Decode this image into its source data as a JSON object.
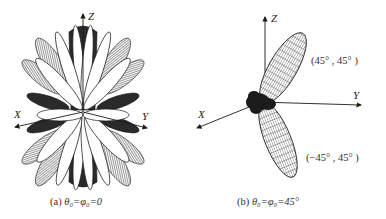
{
  "figures": [
    {
      "id": "a",
      "caption": "(a) θ₀=φ₀=0",
      "caption_prefix": "(a) ",
      "caption_math": "θ₀=φ₀=0",
      "axes": {
        "x_label": "X",
        "y_label": "Y",
        "z_label": "Z"
      },
      "description": "3D radiation pattern with many symmetric lobes around the Z axis"
    },
    {
      "id": "b",
      "caption": "(b) θ₀=φ₀=45°",
      "caption_prefix": "(b) ",
      "caption_math": "θ₀=φ₀=45°",
      "axes": {
        "x_label": "X",
        "y_label": "Y",
        "z_label": "Z"
      },
      "annotations": [
        {
          "text": "(45° , 45° )"
        },
        {
          "text": "(−45° , 45° )"
        }
      ],
      "description": "3D radiation pattern with two main beams steered to (45°,45°) and (−45°,45°)"
    }
  ],
  "colors": {
    "stroke": "#1a1a1a",
    "fill_dark": "#2a2a2a",
    "fill_light": "#ffffff",
    "text": "#333333"
  }
}
